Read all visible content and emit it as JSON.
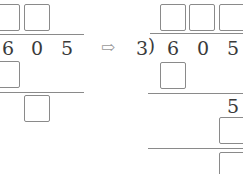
{
  "left_problem": {
    "dividend_digits": [
      "6",
      "0",
      "5"
    ]
  },
  "arrow": {
    "icon": "double-right-arrow-icon",
    "glyph": "⇨"
  },
  "right_problem": {
    "divisor": "3",
    "bracket": ")",
    "dividend_digits": [
      "6",
      "0",
      "5"
    ],
    "brought_down_digit": "5"
  }
}
